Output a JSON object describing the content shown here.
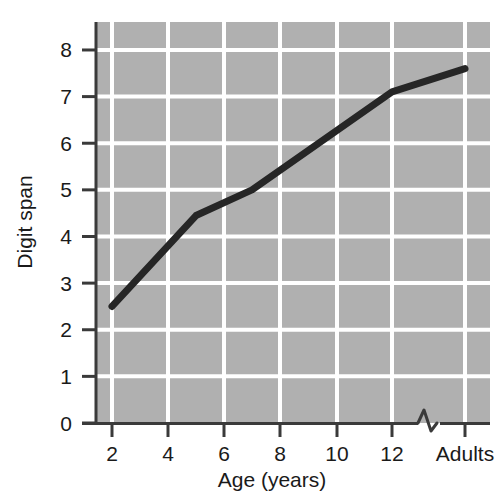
{
  "chart_data": {
    "type": "line",
    "title": "",
    "xlabel": "Age (years)",
    "ylabel": "Digit span",
    "x_tick_labels": [
      "2",
      "4",
      "6",
      "8",
      "10",
      "12",
      "Adults"
    ],
    "x_tick_values": [
      2,
      4,
      6,
      8,
      10,
      12,
      15
    ],
    "y_tick_labels": [
      "0",
      "1",
      "2",
      "3",
      "4",
      "5",
      "6",
      "7",
      "8"
    ],
    "y_tick_values": [
      0,
      1,
      2,
      3,
      4,
      5,
      6,
      7,
      8
    ],
    "xlim": [
      1,
      16
    ],
    "ylim": [
      0,
      8.6
    ],
    "grid": true,
    "grid_color": "#ffffff",
    "plot_background": "#b0b0b0",
    "legend": "none",
    "axis_break": {
      "present": true,
      "between": [
        "12",
        "Adults"
      ],
      "symbol": "zigzag"
    },
    "series": [
      {
        "name": "Digit span by age",
        "color": "#262626",
        "line_width": 7,
        "x": [
          2,
          5,
          7,
          12,
          15
        ],
        "x_labels": [
          "2",
          "5",
          "7",
          "12",
          "Adults"
        ],
        "values": [
          2.5,
          4.45,
          5.0,
          7.1,
          7.6
        ]
      }
    ],
    "annotations": []
  },
  "axes": {
    "y_axis_title": "Digit span",
    "x_axis_title": "Age (years)"
  }
}
